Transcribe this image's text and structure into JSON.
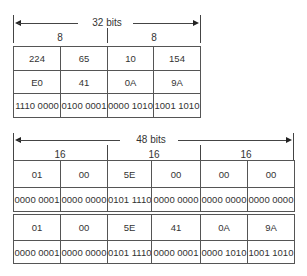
{
  "top": {
    "width_label": "32 bits",
    "group_labels": [
      "8",
      "8"
    ],
    "rows": [
      [
        "224",
        "65",
        "10",
        "154"
      ],
      [
        "E0",
        "41",
        "0A",
        "9A"
      ],
      [
        "1110 0000",
        "0100 0001",
        "0000 1010",
        "1001 1010"
      ]
    ]
  },
  "bottom": {
    "width_label": "48 bits",
    "group_labels": [
      "16",
      "16",
      "16"
    ],
    "table1": [
      [
        "01",
        "00",
        "5E",
        "00",
        "00",
        "00"
      ],
      [
        "0000 0001",
        "0000 0000",
        "0101 1110",
        "0000 0000",
        "0000 0000",
        "0000 0000"
      ]
    ],
    "table2": [
      [
        "01",
        "00",
        "5E",
        "41",
        "0A",
        "9A"
      ],
      [
        "0000 0001",
        "0000 0000",
        "0101 1110",
        "0000 0001",
        "0000 1010",
        "1001 1010"
      ]
    ]
  }
}
